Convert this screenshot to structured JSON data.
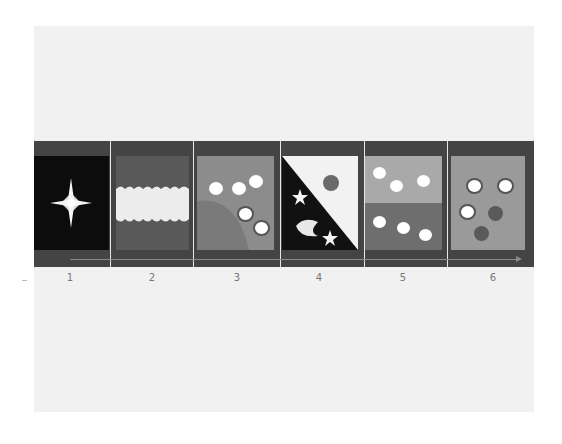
{
  "diagram": {
    "type": "filmstrip-sequence",
    "panel_count": 6,
    "labels": [
      "1",
      "2",
      "3",
      "4",
      "5",
      "6"
    ],
    "colors": {
      "canvas": "#f1f1f1",
      "strip": "#444444",
      "panel1_bg": "#0c0c0c",
      "panel2_bg": "#595959",
      "panel2_band": "#ececec",
      "panel3_bg": "#8c8c8c",
      "panel3_hill": "#7a7a7a",
      "panel4_light": "#f2f2f2",
      "panel4_dark": "#111111",
      "panel5_top": "#a9a9a9",
      "panel5_bottom": "#6e6e6e",
      "panel6_bg": "#9a9a9a",
      "dark_dot": "#5a5a5a"
    },
    "panels": [
      {
        "id": 1,
        "label": "1",
        "content": "four-point star on black"
      },
      {
        "id": 2,
        "label": "2",
        "content": "light band with scalloped edges on gray"
      },
      {
        "id": 3,
        "label": "3",
        "content": "five white dots over a hill"
      },
      {
        "id": 4,
        "label": "4",
        "content": "diagonal split: sun on light, stars and crescent moon on dark"
      },
      {
        "id": 5,
        "label": "5",
        "content": "three dots on top half, three dots on bottom half"
      },
      {
        "id": 6,
        "label": "6",
        "content": "three outlined white dots and two dark dots"
      }
    ]
  }
}
